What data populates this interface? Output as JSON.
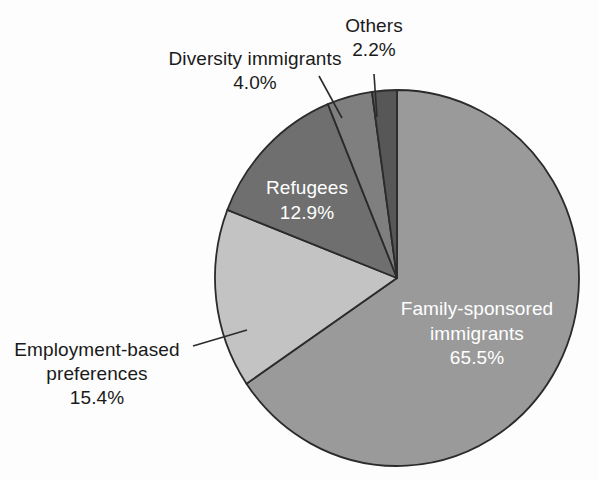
{
  "chart_data": {
    "type": "pie",
    "title": "",
    "subtitle": "",
    "xlabel": "",
    "ylabel": "",
    "legend_position": "none",
    "grid": false,
    "start_angle_deg": 0,
    "direction": "clockwise",
    "units": "percent",
    "categories": [
      "Family-sponsored immigrants",
      "Employment-based preferences",
      "Refugees",
      "Diversity immigrants",
      "Others"
    ],
    "values": [
      65.5,
      15.4,
      12.9,
      4.0,
      2.2
    ],
    "value_labels": [
      "65.5%",
      "15.4%",
      "12.9%",
      "4.0%",
      "2.2%"
    ],
    "colors": [
      "#9a9a9a",
      "#c3c3c3",
      "#6f6f6f",
      "#7f7f7f",
      "#575757"
    ],
    "slices": [
      {
        "name": "Family-sponsored immigrants",
        "value": 65.5,
        "value_label": "65.5%",
        "color": "#9a9a9a",
        "label_placement": "inside",
        "label_color": "#ffffff",
        "name_lines": [
          "Family-sponsored",
          "immigrants"
        ]
      },
      {
        "name": "Employment-based preferences",
        "value": 15.4,
        "value_label": "15.4%",
        "color": "#c3c3c3",
        "label_placement": "outside",
        "label_color": "#1a1a1a",
        "leader_line": true,
        "name_lines": [
          "Employment-based",
          "preferences"
        ]
      },
      {
        "name": "Refugees",
        "value": 12.9,
        "value_label": "12.9%",
        "color": "#6f6f6f",
        "label_placement": "inside",
        "label_color": "#ffffff",
        "name_lines": [
          "Refugees"
        ]
      },
      {
        "name": "Diversity immigrants",
        "value": 4.0,
        "value_label": "4.0%",
        "color": "#7f7f7f",
        "label_placement": "outside",
        "label_color": "#1a1a1a",
        "leader_line": true,
        "name_lines": [
          "Diversity immigrants"
        ]
      },
      {
        "name": "Others",
        "value": 2.2,
        "value_label": "2.2%",
        "color": "#575757",
        "label_placement": "outside",
        "label_color": "#1a1a1a",
        "leader_line": true,
        "name_lines": [
          "Others"
        ]
      }
    ],
    "total": 100.0
  },
  "labels": {
    "others_name": "Others",
    "others_value": "2.2%",
    "diversity_name": "Diversity immigrants",
    "diversity_value": "4.0%",
    "refugees_name": "Refugees",
    "refugees_value": "12.9%",
    "family_name_line1": "Family-sponsored",
    "family_name_line2": "immigrants",
    "family_value": "65.5%",
    "employment_name_line1": "Employment-based",
    "employment_name_line2": "preferences",
    "employment_value": "15.4%"
  },
  "style": {
    "background": "#fdfdfd",
    "outline": "#2b2b2b",
    "text_dark": "#1a1a1a",
    "text_light": "#ffffff"
  }
}
